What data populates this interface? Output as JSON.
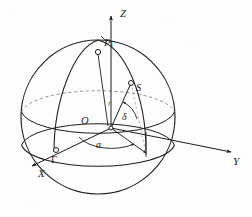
{
  "figure": {
    "background_color": "#fdfdfd",
    "line_color": "#1d1d1d",
    "label_color": "#1d1d1d",
    "width": 252,
    "height": 217
  },
  "axes": [
    {
      "id": "z",
      "label": "Z",
      "direction": "up"
    },
    {
      "id": "y",
      "label": "Y",
      "direction": "right"
    },
    {
      "id": "x",
      "label": "X",
      "direction": "lower-left"
    }
  ],
  "points": [
    {
      "id": "pole",
      "label": "P",
      "subscript": "Γ",
      "marker": "small-circle"
    },
    {
      "id": "star",
      "label": "S",
      "marker": "small-circle"
    },
    {
      "id": "origin",
      "label": "O",
      "marker": "dot"
    },
    {
      "id": "vernal-equinox",
      "label": "Γ",
      "marker": "small-circle"
    }
  ],
  "angles": [
    {
      "id": "right-ascension",
      "label": "α"
    },
    {
      "id": "declination",
      "label": "δ"
    }
  ],
  "segments": [
    {
      "id": "radius-vector",
      "label": "r"
    }
  ],
  "ghost_text": [
    "…",
    "…",
    "…",
    "…"
  ]
}
